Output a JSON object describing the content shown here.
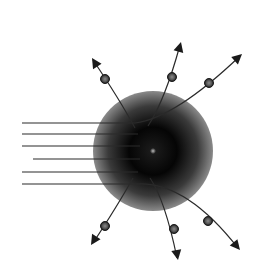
{
  "diagram": {
    "title": "",
    "colors": {
      "background": "#ffffff",
      "line": "#2a2a2a",
      "sphere_core": "#050505",
      "sphere_edge": "#8a8a8a",
      "sphere_highlight": "#bdbdbd",
      "particle_fill": "#6a6a6a",
      "particle_stroke": "#1a1a1a",
      "arrow": "#1a1a1a"
    },
    "incident_rays": {
      "count": 6
    },
    "scattered_particles": {
      "count": 6,
      "upper": 3,
      "lower": 3
    },
    "elements": {
      "target": "sphere",
      "incident": "parallel-rays",
      "outgoing": "arrows-with-particles"
    }
  }
}
